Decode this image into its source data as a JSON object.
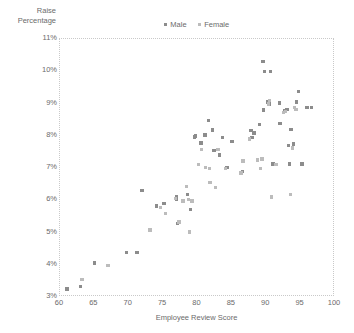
{
  "chart_data": {
    "type": "scatter",
    "title": "",
    "xlabel": "Employee Review Score",
    "ylabel_lines": [
      "Raise",
      "Percentage"
    ],
    "ylabel": "Raise Percentage",
    "xlim": [
      60,
      100
    ],
    "ylim": [
      3,
      11
    ],
    "xticks": [
      "60",
      "65",
      "70",
      "75",
      "80",
      "85",
      "90",
      "95",
      "100"
    ],
    "xtick_values": [
      60,
      65,
      70,
      75,
      80,
      85,
      90,
      95,
      100
    ],
    "yticks": [
      "3%",
      "4%",
      "5%",
      "6%",
      "7%",
      "8%",
      "9%",
      "10%",
      "11%"
    ],
    "ytick_values": [
      3,
      4,
      5,
      6,
      7,
      8,
      9,
      10,
      11
    ],
    "grid": true,
    "grid_style": "dotted",
    "legend_position": "top-center",
    "colors": {
      "male": "#8c8c8c",
      "female": "#bcbcbc",
      "grid": "#c9c9c9",
      "text": "#6b6b6b",
      "background": "#ffffff"
    },
    "series": [
      {
        "name": "Male",
        "color": "#8c8c8c",
        "marker": "square",
        "points": [
          [
            61.0,
            3.25
          ],
          [
            63.0,
            3.33
          ],
          [
            65.0,
            4.05
          ],
          [
            69.7,
            4.38
          ],
          [
            71.2,
            4.38
          ],
          [
            71.9,
            6.3
          ],
          [
            74.0,
            5.82
          ],
          [
            75.1,
            5.9
          ],
          [
            76.9,
            6.12
          ],
          [
            76.9,
            6.02
          ],
          [
            77.1,
            5.28
          ],
          [
            78.5,
            6.18
          ],
          [
            79.0,
            5.72
          ],
          [
            79.6,
            7.96
          ],
          [
            79.7,
            7.99
          ],
          [
            80.5,
            7.78
          ],
          [
            81.1,
            8.02
          ],
          [
            81.6,
            8.48
          ],
          [
            82.2,
            8.18
          ],
          [
            82.4,
            7.55
          ],
          [
            83.2,
            7.4
          ],
          [
            83.6,
            7.95
          ],
          [
            84.3,
            7.02
          ],
          [
            85.0,
            7.82
          ],
          [
            86.5,
            6.9
          ],
          [
            87.8,
            8.16
          ],
          [
            87.9,
            7.95
          ],
          [
            88.2,
            8.08
          ],
          [
            89.0,
            8.35
          ],
          [
            89.5,
            10.3
          ],
          [
            89.6,
            8.8
          ],
          [
            89.7,
            10.0
          ],
          [
            90.2,
            9.05
          ],
          [
            90.4,
            8.98
          ],
          [
            90.6,
            10.0
          ],
          [
            91.0,
            7.12
          ],
          [
            91.9,
            9.02
          ],
          [
            92.0,
            8.38
          ],
          [
            92.7,
            8.78
          ],
          [
            93.0,
            8.82
          ],
          [
            93.2,
            7.7
          ],
          [
            93.4,
            7.12
          ],
          [
            93.6,
            8.2
          ],
          [
            94.0,
            7.75
          ],
          [
            94.4,
            9.05
          ],
          [
            94.7,
            9.38
          ],
          [
            95.2,
            7.12
          ],
          [
            95.9,
            8.88
          ],
          [
            96.6,
            8.88
          ]
        ]
      },
      {
        "name": "Female",
        "color": "#bcbcbc",
        "marker": "square",
        "points": [
          [
            63.2,
            3.55
          ],
          [
            67.0,
            3.97
          ],
          [
            73.1,
            5.08
          ],
          [
            74.6,
            5.78
          ],
          [
            75.3,
            5.58
          ],
          [
            76.8,
            6.05
          ],
          [
            77.3,
            5.33
          ],
          [
            77.9,
            5.98
          ],
          [
            78.4,
            6.42
          ],
          [
            78.7,
            6.02
          ],
          [
            78.8,
            5.02
          ],
          [
            79.2,
            5.98
          ],
          [
            80.1,
            7.1
          ],
          [
            80.6,
            7.58
          ],
          [
            81.2,
            7.02
          ],
          [
            81.7,
            6.98
          ],
          [
            81.8,
            6.55
          ],
          [
            82.6,
            6.4
          ],
          [
            83.0,
            7.58
          ],
          [
            84.1,
            6.98
          ],
          [
            86.3,
            6.85
          ],
          [
            86.6,
            7.22
          ],
          [
            87.6,
            7.9
          ],
          [
            88.7,
            7.25
          ],
          [
            89.2,
            6.98
          ],
          [
            89.4,
            7.28
          ],
          [
            90.3,
            8.98
          ],
          [
            90.5,
            9.1
          ],
          [
            90.8,
            6.1
          ],
          [
            91.4,
            7.1
          ],
          [
            92.5,
            8.72
          ],
          [
            92.8,
            8.75
          ],
          [
            93.5,
            6.18
          ],
          [
            93.8,
            7.62
          ],
          [
            94.1,
            8.88
          ],
          [
            94.3,
            8.82
          ]
        ]
      }
    ]
  },
  "legend": {
    "items": [
      {
        "label": "Male"
      },
      {
        "label": "Female"
      }
    ]
  }
}
